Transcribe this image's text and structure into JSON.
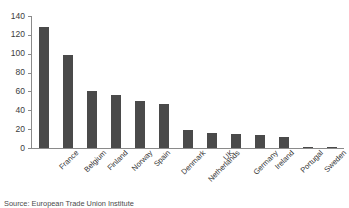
{
  "chart_data": {
    "type": "bar",
    "title": "",
    "xlabel": "",
    "ylabel": "",
    "ylim": [
      0,
      140
    ],
    "yticks": [
      0,
      20,
      40,
      60,
      80,
      100,
      120,
      140
    ],
    "grid": false,
    "legend": null,
    "bar_color": "#4a4a4a",
    "axis_color": "#8a8a8a",
    "categories": [
      "France",
      "Belgium",
      "Finland",
      "Norway",
      "Spain",
      "Denmark",
      "Netherlands",
      "UK",
      "Germany",
      "Ireland",
      "Portugal",
      "Sweden",
      "Switzerland"
    ],
    "values": [
      128,
      99,
      60,
      56,
      50,
      47,
      19,
      16,
      15,
      14,
      12,
      1.5,
      1
    ]
  },
  "source": {
    "text": "Source: European Trade Union Institute"
  }
}
